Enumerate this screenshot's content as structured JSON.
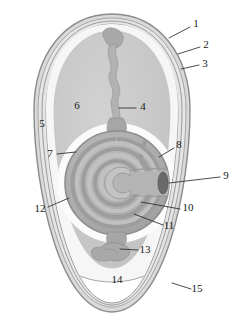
{
  "figure": {
    "type": "labeled-anatomical-diagram",
    "background_color": "#ffffff",
    "outline_color": "#8f8f8f",
    "label_color": "#1a1a1a",
    "leader_color": "#2b2b2b"
  },
  "palette": {
    "shell_outer": "#b4b4b4",
    "shell_mid": "#d6d6d6",
    "membrane_line": "#9a9a9a",
    "thin_albumen": "#f4f4f4",
    "thick_albumen": "#c9c9c9",
    "chalaziferous": "#ffffff",
    "yolk_body": "#b0b0b0",
    "yolk_ring_dark": "#9b9b9b",
    "yolk_ring_light": "#c0c0c0",
    "germinal_disc": "#6a6a6a",
    "chalaza": "#a8a8a8",
    "air_cell": "#ffffff"
  },
  "labels": [
    {
      "id": "1",
      "text": "1",
      "x": 196,
      "y": 24,
      "lx1": 190,
      "ly1": 27,
      "lx2": 169,
      "ly2": 38
    },
    {
      "id": "2",
      "text": "2",
      "x": 206,
      "y": 45,
      "lx1": 200,
      "ly1": 47,
      "lx2": 178,
      "ly2": 54
    },
    {
      "id": "3",
      "text": "3",
      "x": 205,
      "y": 64,
      "lx1": 199,
      "ly1": 65,
      "lx2": 181,
      "ly2": 69
    },
    {
      "id": "4",
      "text": "4",
      "x": 143,
      "y": 107,
      "lx1": 136,
      "ly1": 108,
      "lx2": 119,
      "ly2": 108
    },
    {
      "id": "5",
      "text": "5",
      "x": 42,
      "y": 124,
      "lx1": null,
      "ly1": null,
      "lx2": null,
      "ly2": null
    },
    {
      "id": "6",
      "text": "6",
      "x": 77,
      "y": 106,
      "lx1": null,
      "ly1": null,
      "lx2": null,
      "ly2": null
    },
    {
      "id": "7",
      "text": "7",
      "x": 50,
      "y": 154,
      "lx1": 57,
      "ly1": 154,
      "lx2": 76,
      "ly2": 152
    },
    {
      "id": "8",
      "text": "8",
      "x": 179,
      "y": 145,
      "lx1": 174,
      "ly1": 148,
      "lx2": 159,
      "ly2": 157
    },
    {
      "id": "9",
      "text": "9",
      "x": 226,
      "y": 176,
      "lx1": 220,
      "ly1": 177,
      "lx2": 166,
      "ly2": 183
    },
    {
      "id": "10",
      "text": "10",
      "x": 188,
      "y": 208,
      "lx1": 180,
      "ly1": 209,
      "lx2": 141,
      "ly2": 202
    },
    {
      "id": "11",
      "text": "11",
      "x": 169,
      "y": 226,
      "lx1": 163,
      "ly1": 225,
      "lx2": 134,
      "ly2": 214
    },
    {
      "id": "12",
      "text": "12",
      "x": 40,
      "y": 209,
      "lx1": 48,
      "ly1": 207,
      "lx2": 69,
      "ly2": 198
    },
    {
      "id": "13",
      "text": "13",
      "x": 145,
      "y": 250,
      "lx1": 138,
      "ly1": 250,
      "lx2": 118,
      "ly2": 249
    },
    {
      "id": "14",
      "text": "14",
      "x": 117,
      "y": 280,
      "lx1": null,
      "ly1": null,
      "lx2": null,
      "ly2": null
    },
    {
      "id": "15",
      "text": "15",
      "x": 197,
      "y": 289,
      "lx1": 191,
      "ly1": 289,
      "lx2": 172,
      "ly2": 283
    }
  ],
  "geometry": {
    "egg_center_x": 112,
    "egg_top_y": 14,
    "egg_bottom_y": 312,
    "yolk_center_x": 117,
    "yolk_center_y": 183,
    "yolk_radius": 52,
    "germinal_disc_x": 163,
    "germinal_disc_y": 183,
    "shell_layer_count": 4,
    "yolk_ring_count": 7
  }
}
